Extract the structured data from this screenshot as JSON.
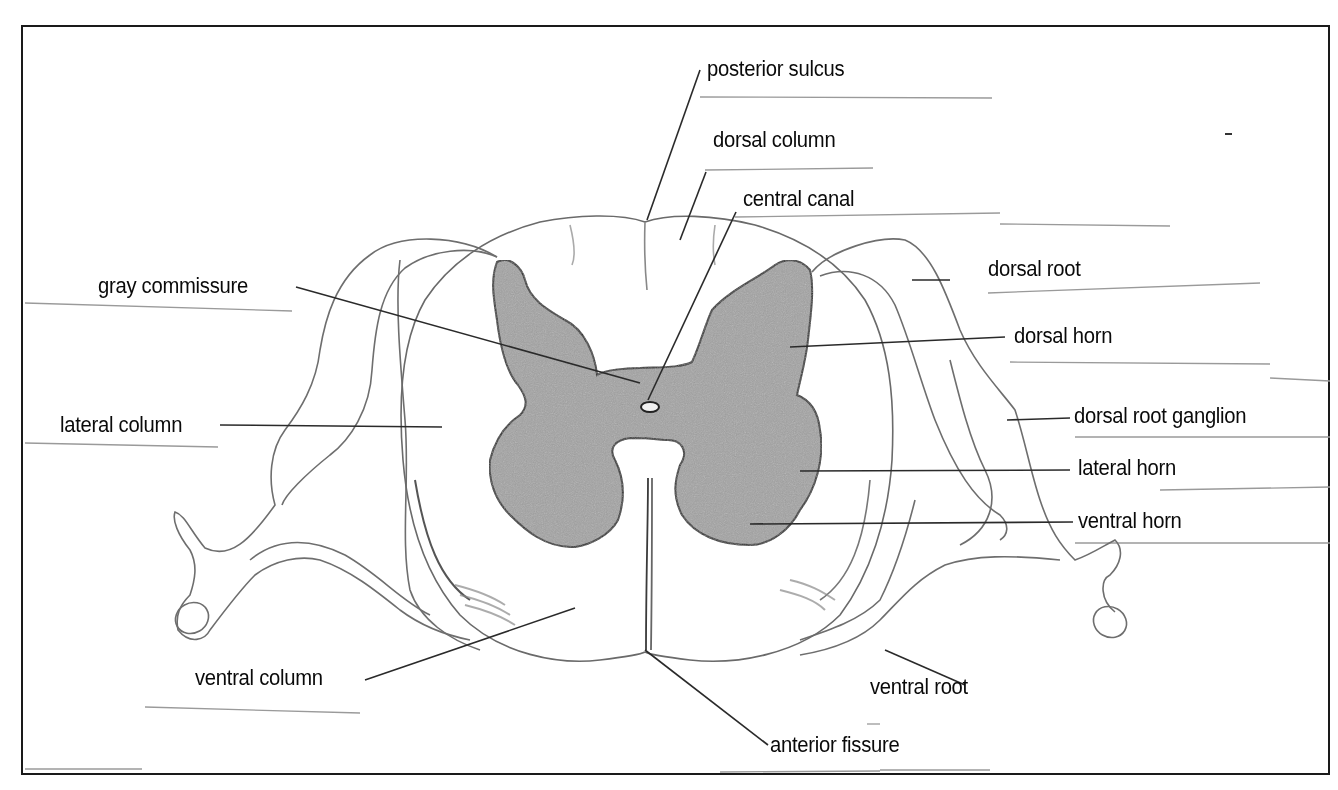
{
  "diagram": {
    "type": "anatomical-cross-section",
    "colors": {
      "outline": "#1a1a1a",
      "gray_matter": "#9a9a9a",
      "sketch_line": "#6e6e6e",
      "leader_line": "#333333",
      "answer_line": "#8a8a8a",
      "background": "#ffffff"
    },
    "labels": [
      {
        "id": "posterior-sulcus",
        "text": "posterior sulcus"
      },
      {
        "id": "dorsal-column",
        "text": "dorsal column"
      },
      {
        "id": "central-canal",
        "text": "central canal"
      },
      {
        "id": "gray-commissure",
        "text": "gray commissure"
      },
      {
        "id": "dorsal-root",
        "text": "dorsal root"
      },
      {
        "id": "dorsal-horn",
        "text": "dorsal horn"
      },
      {
        "id": "lateral-column",
        "text": "lateral column"
      },
      {
        "id": "dorsal-root-ganglion",
        "text": "dorsal root ganglion"
      },
      {
        "id": "lateral-horn",
        "text": "lateral horn"
      },
      {
        "id": "ventral-horn",
        "text": "ventral horn"
      },
      {
        "id": "ventral-column",
        "text": "ventral column"
      },
      {
        "id": "ventral-root",
        "text": "ventral root"
      },
      {
        "id": "anterior-fissure",
        "text": "anterior fissure"
      }
    ]
  }
}
